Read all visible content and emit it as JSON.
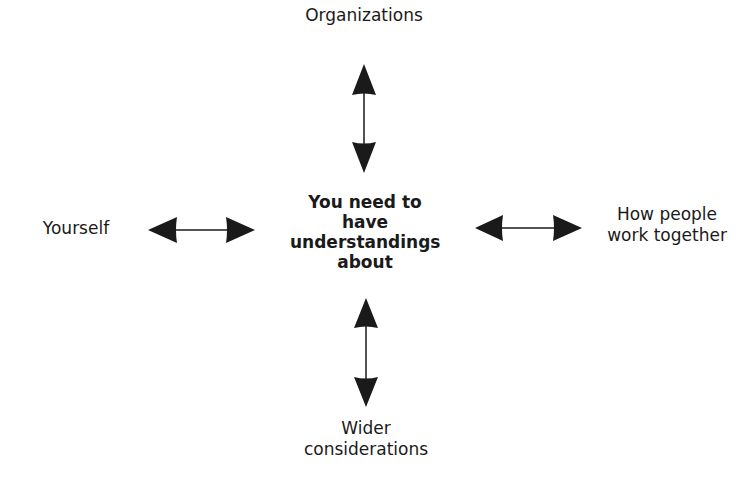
{
  "diagram": {
    "center": {
      "lines": [
        "You need to",
        "have",
        "understandings",
        "about"
      ]
    },
    "nodes": {
      "top": {
        "label": "Organizations"
      },
      "left": {
        "label": "Yourself"
      },
      "right": {
        "lines": [
          "How people",
          "work together"
        ]
      },
      "bottom": {
        "lines": [
          "Wider",
          "considerations"
        ]
      }
    },
    "arrows": [
      {
        "name": "top",
        "type": "double-headed",
        "orientation": "vertical"
      },
      {
        "name": "left",
        "type": "double-headed",
        "orientation": "horizontal"
      },
      {
        "name": "right",
        "type": "double-headed",
        "orientation": "horizontal"
      },
      {
        "name": "bottom",
        "type": "double-headed",
        "orientation": "vertical"
      }
    ],
    "colors": {
      "ink": "#1a1a1a",
      "background": "#ffffff"
    }
  }
}
